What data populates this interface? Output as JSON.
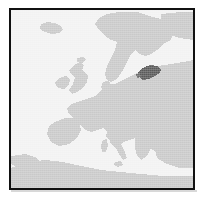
{
  "figure": {
    "kind": "locator-map"
  },
  "map": {
    "region": "Europe",
    "projection_hint": "equirectangular",
    "highlighted_country": "Estonia",
    "labels": [],
    "visible_landmasses": [
      "Iceland",
      "Scandinavia",
      "British Isles",
      "Iberian Peninsula",
      "Italy",
      "Continental Europe",
      "Eastern Europe",
      "Anatolia",
      "North Africa"
    ],
    "visible_water_bodies": [
      "North Atlantic Ocean",
      "North Sea",
      "Baltic Sea",
      "Mediterranean Sea",
      "Black Sea"
    ]
  },
  "colors": {
    "land": "#c9c9c9",
    "sea": "#f2f2f2",
    "highlight": "#5a5a5a",
    "frame": "#111111",
    "page_background": "#ffffff",
    "shadow": "#d8d8d8"
  },
  "frame": {
    "border_width_px": 2,
    "inner_width_px": 182,
    "inner_height_px": 178
  }
}
